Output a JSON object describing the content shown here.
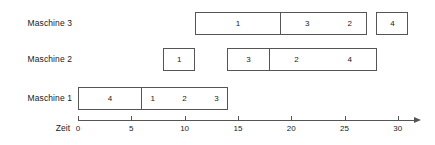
{
  "chart_data": {
    "type": "bar",
    "chart_subtype": "gantt",
    "title": "",
    "xlabel": "Zeit",
    "ylabel": "",
    "xlim": [
      0,
      31.5
    ],
    "grid": false,
    "legend": "none",
    "x_ticks": [
      0,
      5,
      10,
      15,
      20,
      25,
      30
    ],
    "x_tick_labels": [
      "0",
      "5",
      "10",
      "15",
      "20",
      "25",
      "30"
    ],
    "categories": [
      "Maschine 1",
      "Maschine 2",
      "Maschine 3"
    ],
    "rows": [
      {
        "label": "Maschine 3",
        "tasks": [
          {
            "label": "1",
            "start": 11,
            "end": 19
          },
          {
            "label": "3",
            "start": 19,
            "end": 24
          },
          {
            "label": "2",
            "start": 24,
            "end": 27
          },
          {
            "label": "4",
            "start": 28,
            "end": 31
          }
        ]
      },
      {
        "label": "Maschine 2",
        "tasks": [
          {
            "label": "1",
            "start": 8,
            "end": 11
          },
          {
            "label": "3",
            "start": 14,
            "end": 18
          },
          {
            "label": "2",
            "start": 18,
            "end": 23
          },
          {
            "label": "4",
            "start": 23,
            "end": 28
          }
        ]
      },
      {
        "label": "Maschine 1",
        "tasks": [
          {
            "label": "4",
            "start": 0,
            "end": 6
          },
          {
            "label": "1",
            "start": 6,
            "end": 8
          },
          {
            "label": "2",
            "start": 8,
            "end": 12
          },
          {
            "label": "3",
            "start": 12,
            "end": 14
          }
        ]
      }
    ]
  },
  "axis": {
    "title": "Zeit",
    "colors": {
      "line": "#555555",
      "bar_border": "#555555",
      "bar_fill": "#ffffff",
      "text": "#1a1a1a",
      "background": "#ffffff"
    }
  }
}
